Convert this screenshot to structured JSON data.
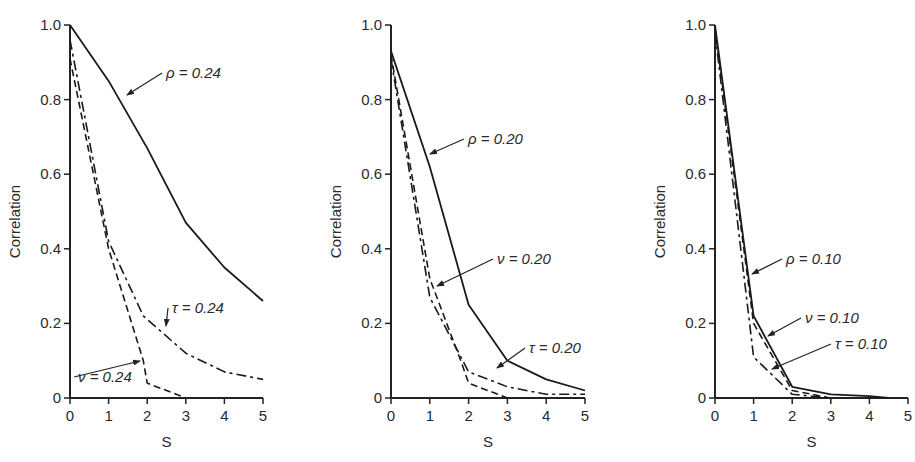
{
  "chart_data": [
    {
      "type": "line",
      "title": "",
      "xlabel": "S",
      "ylabel": "Correlation",
      "xlim": [
        0,
        5
      ],
      "ylim": [
        0,
        1.0
      ],
      "xticks": [
        "0",
        "1",
        "2",
        "3",
        "4",
        "5"
      ],
      "yticks": [
        "0",
        "0.2",
        "0.4",
        "0.6",
        "0.8",
        "1.0"
      ],
      "grid": false,
      "legend": "inline annotations with arrows",
      "series": [
        {
          "name": "ρ = 0.24",
          "style": "solid",
          "x": [
            0,
            1,
            2,
            3,
            4,
            5
          ],
          "y": [
            1.0,
            0.85,
            0.67,
            0.47,
            0.35,
            0.26
          ]
        },
        {
          "name": "τ = 0.24",
          "style": "dash-dot",
          "x": [
            0,
            1,
            1.9,
            3,
            4,
            5
          ],
          "y": [
            0.96,
            0.42,
            0.22,
            0.12,
            0.07,
            0.05
          ]
        },
        {
          "name": "ν = 0.24",
          "style": "dashed",
          "x": [
            0,
            1,
            1.9,
            2,
            3
          ],
          "y": [
            0.91,
            0.4,
            0.1,
            0.04,
            0.0
          ]
        }
      ],
      "annotations": [
        {
          "text": "ρ = 0.24",
          "label_at": [
            166,
            78
          ],
          "arrow_to": [
            127,
            95
          ]
        },
        {
          "text": "τ = 0.24",
          "label_at": [
            172,
            313
          ],
          "arrow_to": [
            166,
            326
          ]
        },
        {
          "text": "ν = 0.24",
          "label_at": [
            78,
            382
          ],
          "arrow_to": [
            140,
            361
          ]
        }
      ]
    },
    {
      "type": "line",
      "title": "",
      "xlabel": "S",
      "ylabel": "Correlation",
      "xlim": [
        0,
        5
      ],
      "ylim": [
        0,
        1.0
      ],
      "xticks": [
        "0",
        "1",
        "2",
        "3",
        "4",
        "5"
      ],
      "yticks": [
        "0",
        "0.2",
        "0.4",
        "0.6",
        "0.8",
        "1.0"
      ],
      "grid": false,
      "legend": "inline annotations with arrows",
      "series": [
        {
          "name": "ρ = 0.20",
          "style": "solid",
          "x": [
            0,
            1,
            2,
            3,
            4,
            5
          ],
          "y": [
            0.93,
            0.62,
            0.25,
            0.1,
            0.05,
            0.02
          ]
        },
        {
          "name": "ν = 0.20",
          "style": "dashed",
          "x": [
            0,
            1,
            1.8,
            2,
            3
          ],
          "y": [
            0.92,
            0.32,
            0.1,
            0.04,
            0.0
          ]
        },
        {
          "name": "τ = 0.20",
          "style": "dash-dot",
          "x": [
            0,
            1,
            2,
            3,
            4,
            5
          ],
          "y": [
            0.91,
            0.27,
            0.07,
            0.03,
            0.01,
            0.01
          ]
        }
      ],
      "annotations": [
        {
          "text": "ρ = 0.20",
          "label_at": [
            468,
            144
          ],
          "arrow_to": [
            430,
            154
          ]
        },
        {
          "text": "ν = 0.20",
          "label_at": [
            497,
            264
          ],
          "arrow_to": [
            437,
            286
          ]
        },
        {
          "text": "τ = 0.20",
          "label_at": [
            529,
            353
          ],
          "arrow_to": [
            497,
            368
          ]
        }
      ]
    },
    {
      "type": "line",
      "title": "",
      "xlabel": "S",
      "ylabel": "Correlation",
      "xlim": [
        0,
        5
      ],
      "ylim": [
        0,
        1.0
      ],
      "xticks": [
        "0",
        "1",
        "2",
        "3",
        "4",
        "5"
      ],
      "yticks": [
        "0",
        "0.2",
        "0.4",
        "0.6",
        "0.8",
        "1.0"
      ],
      "grid": false,
      "legend": "inline annotations with arrows",
      "series": [
        {
          "name": "ρ = 0.10",
          "style": "solid",
          "x": [
            0,
            1,
            2,
            3,
            4,
            4.5
          ],
          "y": [
            1.0,
            0.22,
            0.03,
            0.01,
            0.005,
            0.0
          ]
        },
        {
          "name": "ν = 0.10",
          "style": "dashed",
          "x": [
            0,
            1,
            2,
            3
          ],
          "y": [
            0.99,
            0.2,
            0.02,
            0.0
          ]
        },
        {
          "name": "τ = 0.10",
          "style": "dash-dot",
          "x": [
            0,
            1,
            2,
            3
          ],
          "y": [
            0.98,
            0.11,
            0.01,
            0.0
          ]
        }
      ],
      "annotations": [
        {
          "text": "ρ = 0.10",
          "label_at": [
            786,
            264
          ],
          "arrow_to": [
            752,
            274
          ]
        },
        {
          "text": "ν = 0.10",
          "label_at": [
            805,
            323
          ],
          "arrow_to": [
            768,
            336
          ]
        },
        {
          "text": "τ = 0.10",
          "label_at": [
            835,
            349
          ],
          "arrow_to": [
            772,
            369
          ]
        }
      ]
    }
  ]
}
